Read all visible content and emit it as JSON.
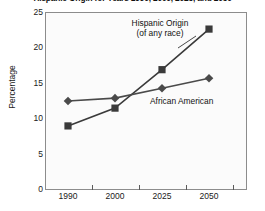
{
  "chart_data": {
    "type": "line",
    "title": "Hispanic Origin for Years 1990, 2000, 2025, and 2050",
    "xlabel": "",
    "ylabel": "Percentage",
    "categories": [
      "1990",
      "2000",
      "2025",
      "2050"
    ],
    "x": [
      1990,
      2000,
      2025,
      2050
    ],
    "ylim": [
      0,
      25
    ],
    "yticks": [
      0,
      5,
      10,
      15,
      20,
      25
    ],
    "ytick_labels": [
      "0",
      "5",
      "10",
      "15",
      "20",
      "25"
    ],
    "xtick_labels": [
      "1990",
      "2000",
      "2025",
      "2050"
    ],
    "grid": false,
    "legend_position": "inline-annotations",
    "series": [
      {
        "name": "Hispanic Origin (of any race)",
        "marker": "square",
        "color": "#3a3a3a",
        "values": [
          9.0,
          11.5,
          16.9,
          22.6
        ]
      },
      {
        "name": "African American",
        "marker": "diamond",
        "color": "#4a4a4a",
        "values": [
          12.5,
          12.9,
          14.3,
          15.7
        ]
      }
    ],
    "annotations": [
      {
        "name": "hispanic-origin-label",
        "line1": "Hispanic Origin",
        "line2": "(of any race)"
      },
      {
        "name": "african-american-label",
        "line1": "African American"
      }
    ]
  },
  "axis": {
    "y_title": "Percentage",
    "y_labels": [
      "25",
      "20",
      "15",
      "10",
      "5",
      "0"
    ],
    "x_labels": [
      "1990",
      "2000",
      "2025",
      "2050"
    ]
  },
  "colors": {
    "series_hispanic": "#3a3a3a",
    "series_african": "#4a4a4a",
    "frame": "#8c8c8c",
    "plot_background": "#fbfbfb",
    "text": "#1a1a1a"
  }
}
